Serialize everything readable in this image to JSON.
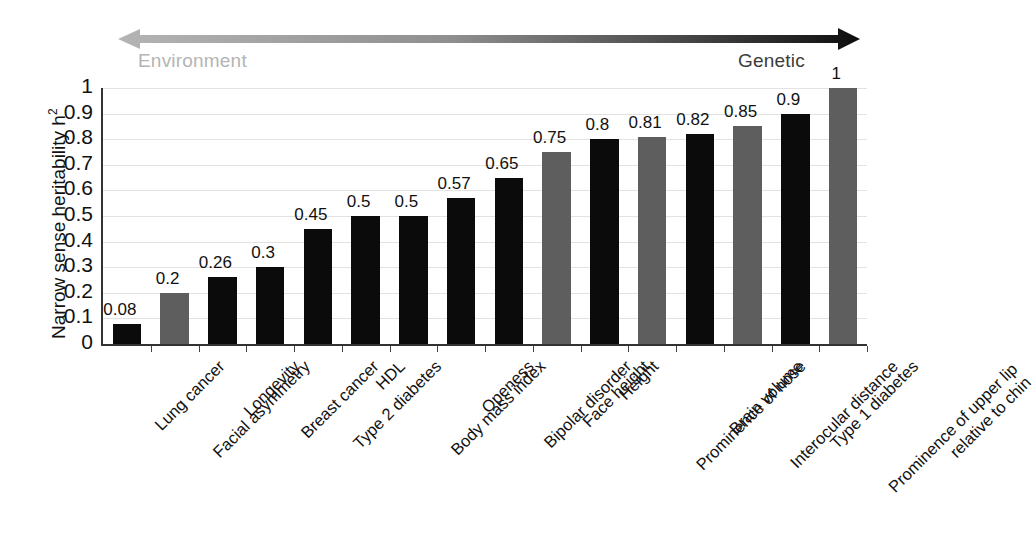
{
  "axis_annotation": {
    "left_label": "Environment",
    "right_label": "Genetic",
    "arrow_name": "environment-genetic-gradient-arrow",
    "gradient_from": "#b0b0b0",
    "gradient_to": "#0d0d0d"
  },
  "colors": {
    "bar_dark": "#0b0b0b",
    "bar_gray": "#5e5e5e",
    "gridline": "#e2e2e2",
    "axis": "#333333",
    "text": "#111111",
    "muted_text": "#b4b4b4"
  },
  "chart_data": {
    "type": "bar",
    "title": "",
    "xlabel": "",
    "ylabel": "Narrow sense heritability h2",
    "ylabel_base": "Narrow sense heritability h",
    "ylabel_sup": "2",
    "ylim": [
      0,
      1
    ],
    "ytick_labels": [
      "1",
      "0.9",
      "0.8",
      "0.7",
      "0.6",
      "0.5",
      "0.4",
      "0.3",
      "0.2",
      "0.1",
      "0"
    ],
    "ytick_values": [
      1,
      0.9,
      0.8,
      0.7,
      0.6,
      0.5,
      0.4,
      0.3,
      0.2,
      0.1,
      0
    ],
    "grid": true,
    "legend": "none",
    "categories": [
      "Lung cancer",
      "Facial asymmetry",
      "Longevity",
      "Breast cancer",
      "Type 2 diabetes",
      "HDL",
      "Body mass index",
      "Openess",
      "Bipolar disorder",
      "Face height",
      "Height",
      "Prominence of nose",
      "Brain volume",
      "Interocular distance",
      "Type 1 diabetes",
      "Prominence of upper lip relative to chin"
    ],
    "category_lines": [
      [
        "Lung cancer"
      ],
      [
        "Facial asymmetry"
      ],
      [
        "Longevity"
      ],
      [
        "Breast cancer"
      ],
      [
        "Type 2 diabetes"
      ],
      [
        "HDL"
      ],
      [
        "Body mass index"
      ],
      [
        "Openess"
      ],
      [
        "Bipolar disorder"
      ],
      [
        "Face height"
      ],
      [
        "Height"
      ],
      [
        "Prominence of nose"
      ],
      [
        "Brain volume"
      ],
      [
        "Interocular distance"
      ],
      [
        "Type 1 diabetes"
      ],
      [
        "Prominence of upper lip",
        "relative to chin"
      ]
    ],
    "values": [
      0.08,
      0.2,
      0.26,
      0.3,
      0.45,
      0.5,
      0.5,
      0.57,
      0.65,
      0.75,
      0.8,
      0.81,
      0.82,
      0.85,
      0.9,
      1
    ],
    "value_labels": [
      "0.08",
      "0.2",
      "0.26",
      "0.3",
      "0.45",
      "0.5",
      "0.5",
      "0.57",
      "0.65",
      "0.75",
      "0.8",
      "0.81",
      "0.82",
      "0.85",
      "0.9",
      "1"
    ],
    "bar_colors": [
      "dark",
      "gray",
      "dark",
      "dark",
      "dark",
      "dark",
      "dark",
      "dark",
      "dark",
      "gray",
      "dark",
      "gray",
      "dark",
      "gray",
      "dark",
      "gray"
    ]
  }
}
